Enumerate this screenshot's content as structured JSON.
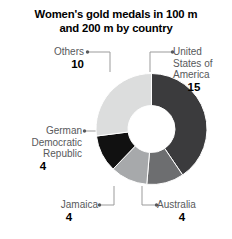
{
  "chart_data": {
    "type": "pie",
    "variant": "donut",
    "title": "Women's gold medals in 100 m and 200 m by country",
    "title_line_1": "Women's gold medals in 100 m",
    "title_line_2": "and 200 m by country",
    "xlabel": "",
    "ylabel": "",
    "total": 37,
    "legend_position": "none",
    "grid": false,
    "categories": [
      "United States of America",
      "Australia",
      "Jamaica",
      "German Democratic Republic",
      "Others"
    ],
    "values": [
      15,
      4,
      4,
      4,
      10
    ],
    "slices": [
      {
        "label": "United States of America",
        "value": 15,
        "color": "#3b3b3d",
        "start_angle": 0,
        "end_angle": 145.9
      },
      {
        "label": "Australia",
        "value": 4,
        "color": "#6d6e70",
        "start_angle": 145.9,
        "end_angle": 184.9
      },
      {
        "label": "Jamaica",
        "value": 4,
        "color": "#a7a9ab",
        "start_angle": 184.9,
        "end_angle": 223.8
      },
      {
        "label": "German Democratic Republic",
        "value": 4,
        "color": "#111111",
        "start_angle": 223.8,
        "end_angle": 262.7
      },
      {
        "label": "Others",
        "value": 10,
        "color": "#dcdddd",
        "start_angle": 262.7,
        "end_angle": 360
      }
    ]
  },
  "labels": {
    "others": {
      "name": "Others",
      "value": "10"
    },
    "usa": {
      "name_line_1": "United",
      "name_line_2": "States of",
      "name_line_3": "America",
      "value": "15"
    },
    "gdr": {
      "name_line_1": "German",
      "name_line_2": "Democratic",
      "name_line_3": "Republic",
      "value": "4"
    },
    "jamaica": {
      "name": "Jamaica",
      "value": "4"
    },
    "australia": {
      "name": "Australia",
      "value": "4"
    }
  },
  "colors": {
    "usa": "#3b3b3d",
    "australia": "#6d6e70",
    "jamaica": "#a7a9ab",
    "gdr": "#111111",
    "others": "#dcdddd",
    "leader": "#9b9b9b",
    "text": "#58595b",
    "value_text": "#000000"
  }
}
